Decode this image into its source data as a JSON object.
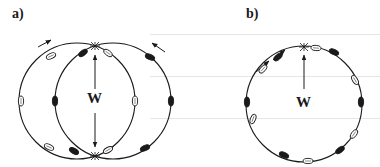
{
  "panels": [
    {
      "id": "a",
      "label": "a)",
      "force_label": "W",
      "circles": [
        {
          "cx": 77,
          "cy": 101,
          "r": 58
        },
        {
          "cx": 113,
          "cy": 101,
          "r": 58
        }
      ],
      "crossings": [
        [
          95,
          46
        ],
        [
          95,
          156
        ]
      ],
      "arrow": {
        "from": [
          95,
          101
        ],
        "to_up": [
          95,
          55
        ],
        "to_down": [
          95,
          147
        ]
      },
      "rotation_arrows": [
        {
          "x1": 38,
          "y1": 47,
          "x2": 51,
          "y2": 40
        },
        {
          "x1": 165,
          "y1": 52,
          "x2": 152,
          "y2": 43
        }
      ],
      "markers": [
        {
          "x": 51,
          "y": 56,
          "angle": -25,
          "filled": false
        },
        {
          "x": 83,
          "y": 53,
          "angle": -35,
          "filled": true
        },
        {
          "x": 108,
          "y": 53,
          "angle": 35,
          "filled": false
        },
        {
          "x": 150,
          "y": 57,
          "angle": 25,
          "filled": true
        },
        {
          "x": 21,
          "y": 101,
          "angle": 90,
          "filled": false
        },
        {
          "x": 55,
          "y": 101,
          "angle": 90,
          "filled": true
        },
        {
          "x": 135,
          "y": 101,
          "angle": 90,
          "filled": false
        },
        {
          "x": 171,
          "y": 101,
          "angle": 90,
          "filled": true
        },
        {
          "x": 49,
          "y": 147,
          "angle": 25,
          "filled": false
        },
        {
          "x": 74,
          "y": 151,
          "angle": 30,
          "filled": true
        },
        {
          "x": 108,
          "y": 150,
          "angle": -30,
          "filled": false
        },
        {
          "x": 145,
          "y": 148,
          "angle": -25,
          "filled": true
        }
      ]
    },
    {
      "id": "b",
      "label": "b)",
      "force_label": "W",
      "circles": [
        {
          "cx": 304,
          "cy": 104,
          "r": 58
        }
      ],
      "crossings": [
        [
          304,
          47
        ]
      ],
      "arrow": {
        "from": [
          304,
          101
        ],
        "to_up": [
          304,
          55
        ]
      },
      "rotation_arrows": [
        {
          "x1": 256,
          "y1": 72,
          "x2": 269,
          "y2": 61
        },
        {
          "x1": 273,
          "y1": 60,
          "x2": 285,
          "y2": 50
        }
      ],
      "markers": [
        {
          "x": 316,
          "y": 48,
          "angle": 5,
          "filled": false
        },
        {
          "x": 334,
          "y": 52,
          "angle": 25,
          "filled": true
        },
        {
          "x": 278,
          "y": 57,
          "angle": -40,
          "filled": true
        },
        {
          "x": 263,
          "y": 69,
          "angle": -50,
          "filled": false
        },
        {
          "x": 355,
          "y": 80,
          "angle": 60,
          "filled": false
        },
        {
          "x": 361,
          "y": 102,
          "angle": 90,
          "filled": true
        },
        {
          "x": 247,
          "y": 102,
          "angle": 90,
          "filled": true
        },
        {
          "x": 253,
          "y": 119,
          "angle": 110,
          "filled": false
        },
        {
          "x": 354,
          "y": 134,
          "angle": -55,
          "filled": false
        },
        {
          "x": 340,
          "y": 150,
          "angle": -35,
          "filled": true
        },
        {
          "x": 284,
          "y": 155,
          "angle": 25,
          "filled": true
        },
        {
          "x": 308,
          "y": 161,
          "angle": 0,
          "filled": false
        }
      ]
    }
  ],
  "colors": {
    "ink": "#1a1a1a",
    "background": "#ffffff",
    "open_marker_fill": "#ffffff"
  }
}
